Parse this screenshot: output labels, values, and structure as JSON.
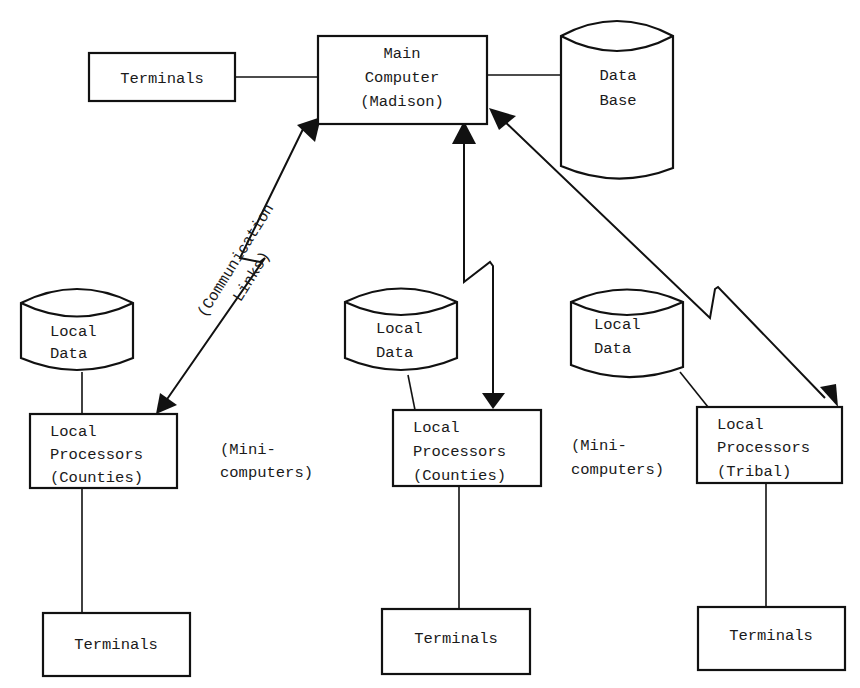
{
  "diagram": {
    "type": "network-architecture",
    "nodes": {
      "top_terminals": {
        "label": [
          "Terminals"
        ]
      },
      "main_computer": {
        "label": [
          "Main",
          "Computer",
          "(Madison)"
        ]
      },
      "data_base": {
        "label": [
          "Data",
          "Base"
        ]
      },
      "left_local_data": {
        "label": [
          "Local",
          "Data"
        ]
      },
      "left_local_processors": {
        "label": [
          "Local",
          "Processors",
          "(Counties)"
        ]
      },
      "left_terminals": {
        "label": [
          "Terminals"
        ]
      },
      "mid_local_data": {
        "label": [
          "Local",
          "Data"
        ]
      },
      "mid_local_processors": {
        "label": [
          "Local",
          "Processors",
          "(Counties)"
        ]
      },
      "mid_terminals": {
        "label": [
          "Terminals"
        ]
      },
      "right_local_data": {
        "label": [
          "Local",
          "Data"
        ]
      },
      "right_local_processors": {
        "label": [
          "Local",
          "Processors",
          "(Tribal)"
        ]
      },
      "right_terminals": {
        "label": [
          "Terminals"
        ]
      }
    },
    "annotations": {
      "communication_links": [
        "(Communication",
        "Links)"
      ],
      "minicomputers_left": [
        "(Mini-",
        "computers)"
      ],
      "minicomputers_right": [
        "(Mini-",
        "computers)"
      ]
    },
    "edges": [
      {
        "from": "top_terminals",
        "to": "main_computer",
        "style": "line"
      },
      {
        "from": "main_computer",
        "to": "data_base",
        "style": "line"
      },
      {
        "from": "main_computer",
        "to": "left_local_processors",
        "style": "bidirectional-lightning-link"
      },
      {
        "from": "main_computer",
        "to": "mid_local_processors",
        "style": "bidirectional-lightning-link"
      },
      {
        "from": "main_computer",
        "to": "right_local_processors",
        "style": "bidirectional-lightning-link"
      },
      {
        "from": "left_local_data",
        "to": "left_local_processors",
        "style": "line"
      },
      {
        "from": "mid_local_data",
        "to": "mid_local_processors",
        "style": "line"
      },
      {
        "from": "right_local_data",
        "to": "right_local_processors",
        "style": "line"
      },
      {
        "from": "left_local_processors",
        "to": "left_terminals",
        "style": "line"
      },
      {
        "from": "mid_local_processors",
        "to": "mid_terminals",
        "style": "line"
      },
      {
        "from": "right_local_processors",
        "to": "right_terminals",
        "style": "line"
      }
    ]
  }
}
